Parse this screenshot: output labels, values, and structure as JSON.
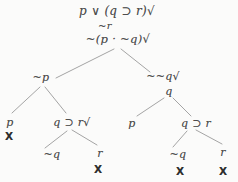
{
  "diagram": {
    "type": "truth-tree",
    "colors": {
      "background": "#fbfbfa",
      "formula_text": "#4d4d4d",
      "closure_mark": "#2e2e2e",
      "branch_line": "#9a9a9a"
    },
    "nodes": [
      {
        "name": "root-formula",
        "label": "p ∨ (q ⊃ r)√",
        "kind": "formula",
        "x": 117,
        "y": 11,
        "size": 12
      },
      {
        "name": "premise-not-r",
        "label": "~r",
        "kind": "formula",
        "x": 105,
        "y": 26,
        "size": 10
      },
      {
        "name": "premise-not-p-and-not-q",
        "label": "~(p · ~q)√",
        "kind": "formula",
        "x": 118,
        "y": 40,
        "size": 11.5
      },
      {
        "name": "left-branch-not-p",
        "label": "~p",
        "kind": "formula",
        "x": 41,
        "y": 77,
        "size": 11
      },
      {
        "name": "right-branch-not-not-q",
        "label": "~~q√",
        "kind": "formula",
        "x": 163,
        "y": 76,
        "size": 11
      },
      {
        "name": "right-branch-q",
        "label": "q",
        "kind": "formula",
        "x": 169,
        "y": 91,
        "size": 11
      },
      {
        "name": "left-left-p",
        "label": "p",
        "kind": "formula",
        "x": 10,
        "y": 122,
        "size": 11
      },
      {
        "name": "left-right-q-implies-r",
        "label": "q ⊃ r√",
        "kind": "formula",
        "x": 72,
        "y": 122,
        "size": 11
      },
      {
        "name": "right-left-p",
        "label": "p",
        "kind": "formula",
        "x": 132,
        "y": 123,
        "size": 11
      },
      {
        "name": "right-right-q-implies-r",
        "label": "q ⊃ r",
        "kind": "formula",
        "x": 196,
        "y": 123,
        "size": 11
      },
      {
        "name": "closure-x-left-p",
        "label": "X",
        "kind": "closure",
        "x": 9,
        "y": 136
      },
      {
        "name": "left-subtree-not-q",
        "label": "~q",
        "kind": "formula",
        "x": 52,
        "y": 154,
        "size": 11
      },
      {
        "name": "left-subtree-r",
        "label": "r",
        "kind": "formula",
        "x": 100,
        "y": 153,
        "size": 11
      },
      {
        "name": "right-subtree-not-q",
        "label": "~q",
        "kind": "formula",
        "x": 178,
        "y": 154,
        "size": 11
      },
      {
        "name": "right-subtree-r",
        "label": "r",
        "kind": "formula",
        "x": 223,
        "y": 152,
        "size": 11
      },
      {
        "name": "closure-x-left-r",
        "label": "X",
        "kind": "closure",
        "x": 98,
        "y": 169
      },
      {
        "name": "closure-x-right-not-q",
        "label": "X",
        "kind": "closure",
        "x": 180,
        "y": 171
      },
      {
        "name": "closure-x-right-r",
        "label": "X",
        "kind": "closure",
        "x": 223,
        "y": 171
      }
    ],
    "edges": [
      {
        "name": "branch-root-to-not-p",
        "x1": 114,
        "y1": 49,
        "x2": 56,
        "y2": 78
      },
      {
        "name": "branch-root-to-not-not-q",
        "x1": 121,
        "y1": 49,
        "x2": 150,
        "y2": 72
      },
      {
        "name": "branch-not-p-to-p",
        "x1": 40,
        "y1": 87,
        "x2": 12,
        "y2": 113
      },
      {
        "name": "branch-not-p-to-q-implies-r",
        "x1": 45,
        "y1": 87,
        "x2": 66,
        "y2": 113
      },
      {
        "name": "branch-q-to-p",
        "x1": 164,
        "y1": 98,
        "x2": 137,
        "y2": 116
      },
      {
        "name": "branch-q-to-q-implies-r",
        "x1": 173,
        "y1": 98,
        "x2": 191,
        "y2": 116
      },
      {
        "name": "branch-left-impl-to-not-q",
        "x1": 67,
        "y1": 131,
        "x2": 45,
        "y2": 148
      },
      {
        "name": "branch-left-impl-to-r",
        "x1": 72,
        "y1": 130,
        "x2": 97,
        "y2": 145
      },
      {
        "name": "branch-right-impl-to-not-q",
        "x1": 187,
        "y1": 131,
        "x2": 173,
        "y2": 147
      },
      {
        "name": "branch-right-impl-to-r",
        "x1": 196,
        "y1": 130,
        "x2": 222,
        "y2": 144
      }
    ]
  }
}
